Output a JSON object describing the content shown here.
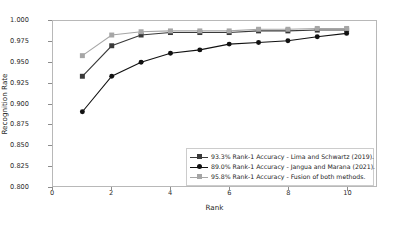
{
  "chart_data": {
    "type": "line",
    "title": "",
    "xlabel": "Rank",
    "ylabel": "Recognition Rate",
    "xlim": [
      0,
      11
    ],
    "ylim": [
      0.8,
      1.0
    ],
    "xticks": [
      0,
      2,
      4,
      6,
      8,
      10
    ],
    "yticks": [
      0.8,
      0.825,
      0.85,
      0.875,
      0.9,
      0.925,
      0.95,
      0.975,
      1.0
    ],
    "ytick_labels": [
      "0.800",
      "0.825",
      "0.850",
      "0.875",
      "0.900",
      "0.925",
      "0.950",
      "0.975",
      "1.000"
    ],
    "xtick_labels": [
      "0",
      "2",
      "4",
      "6",
      "8",
      "10"
    ],
    "grid": false,
    "legend_position": "lower right",
    "x": [
      1,
      2,
      3,
      4,
      5,
      6,
      7,
      8,
      9,
      10
    ],
    "series": [
      {
        "name": "93.3% Rank-1 Accuracy - Lima and Schwartz (2019).",
        "values": [
          0.933,
          0.97,
          0.983,
          0.986,
          0.986,
          0.986,
          0.988,
          0.988,
          0.989,
          0.989
        ],
        "color": "#3a3a3a",
        "marker": "square"
      },
      {
        "name": "89.0% Rank-1 Accuracy - Jangua and Marana (2021).",
        "values": [
          0.89,
          0.933,
          0.95,
          0.961,
          0.965,
          0.972,
          0.974,
          0.976,
          0.981,
          0.985
        ],
        "color": "#111111",
        "marker": "circle"
      },
      {
        "name": "95.8% Rank-1 Accuracy - Fusion of both methods.",
        "values": [
          0.958,
          0.983,
          0.987,
          0.988,
          0.988,
          0.988,
          0.99,
          0.99,
          0.991,
          0.991
        ],
        "color": "#a6a6a6",
        "marker": "square"
      }
    ]
  },
  "axes": {
    "xlabel": "Rank",
    "ylabel": "Recognition Rate"
  },
  "legend": {
    "entries": [
      "93.3% Rank-1 Accuracy - Lima and Schwartz (2019).",
      "89.0% Rank-1 Accuracy - Jangua and Marana (2021).",
      "95.8% Rank-1 Accuracy - Fusion of both methods."
    ]
  }
}
